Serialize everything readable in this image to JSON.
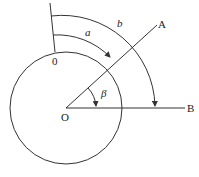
{
  "diagram": {
    "type": "angle-measurement-diagram",
    "center_label": "O",
    "zero_label": "0",
    "ray_labels": [
      "A",
      "B"
    ],
    "arc_labels": [
      "a",
      "b"
    ],
    "angle_label": "β",
    "colors": {
      "stroke": "#333333",
      "background": "#ffffff"
    }
  }
}
